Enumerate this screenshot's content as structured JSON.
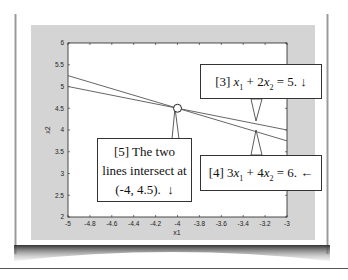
{
  "chart_data": {
    "type": "line",
    "title": "",
    "xlabel": "x1",
    "ylabel": "x2",
    "xlim": [
      -5,
      -3
    ],
    "ylim": [
      2,
      6
    ],
    "grid": false,
    "x_ticks": [
      "-5",
      "-4.8",
      "-4.6",
      "-4.4",
      "-4.2",
      "-4",
      "-3.8",
      "-3.6",
      "-3.4",
      "-3.2",
      "-3"
    ],
    "y_ticks": [
      "2",
      "2.5",
      "3",
      "3.5",
      "4",
      "4.5",
      "5",
      "5.5",
      "6"
    ],
    "series": [
      {
        "name": "x1 + 2x2 = 5",
        "x": [
          -5,
          -3
        ],
        "values": [
          5.0,
          4.0
        ]
      },
      {
        "name": "3x1 + 4x2 = 6",
        "x": [
          -5,
          -3
        ],
        "values": [
          5.25,
          3.75
        ]
      }
    ],
    "intersection": {
      "x": -4,
      "y": 4.5
    },
    "annotations": [
      {
        "id": "3",
        "text": "[3] x1 + 2x2 = 5. ↓",
        "points_to": {
          "x": -3.3,
          "y": 4.15
        }
      },
      {
        "id": "4",
        "text": "[4] 3x1 + 4x2 = 6. ←",
        "points_to": {
          "x": -3.3,
          "y": 3.975
        }
      },
      {
        "id": "5",
        "text": "[5] The two lines intersect at (-4, 4.5). ↓",
        "points_to": {
          "x": -4,
          "y": 4.5
        }
      }
    ]
  },
  "callouts": {
    "c3": {
      "label": "[3]",
      "term1_var": "x",
      "term1_sub": "1",
      "op1": "+ 2",
      "term2_var": "x",
      "term2_sub": "2",
      "rhs": "= 5.",
      "arrow": "↓"
    },
    "c4": {
      "label": "[4]",
      "coef1": "3",
      "term1_var": "x",
      "term1_sub": "1",
      "op1": "+ 4",
      "term2_var": "x",
      "term2_sub": "2",
      "rhs": "= 6.",
      "arrow": "←"
    },
    "c5": {
      "line1": "[5] The two",
      "line2": "lines intersect at",
      "line3": "(-4, 4.5).",
      "arrow": "↓"
    }
  },
  "colors": {
    "figure_bg": "#d4d4d4",
    "axes_bg": "#ffffff",
    "line": "#555555",
    "frame": "#222222"
  }
}
